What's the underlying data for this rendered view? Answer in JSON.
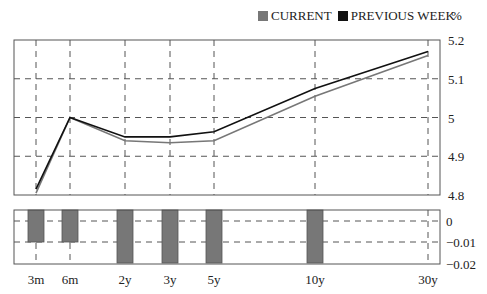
{
  "legend": {
    "items": [
      {
        "label": "CURRENT",
        "color": "#777777"
      },
      {
        "label": "PREVIOUS WEEK",
        "color": "#111111"
      }
    ],
    "unit": "%"
  },
  "chart_data": [
    {
      "type": "line",
      "title": "",
      "categories": [
        "3m",
        "6m",
        "2y",
        "3y",
        "5y",
        "10y",
        "30y"
      ],
      "series": [
        {
          "name": "CURRENT",
          "color": "#777777",
          "values": [
            4.805,
            5.0,
            4.94,
            4.935,
            4.94,
            5.055,
            5.16
          ]
        },
        {
          "name": "PREVIOUS WEEK",
          "color": "#111111",
          "values": [
            4.815,
            5.0,
            4.95,
            4.95,
            4.963,
            5.075,
            5.17
          ]
        }
      ],
      "ylabel": "%",
      "ylim": [
        4.8,
        5.2
      ],
      "yticks": [
        "5.2",
        "5.1",
        "5",
        "4.9",
        "4.8"
      ],
      "grid": true,
      "legend_position": "top-right"
    },
    {
      "type": "bar",
      "title": "",
      "categories": [
        "3m",
        "6m",
        "2y",
        "3y",
        "5y",
        "10y",
        "30y"
      ],
      "values": [
        -0.01,
        -0.01,
        -0.02,
        -0.02,
        -0.02,
        -0.02,
        0
      ],
      "color": "#777777",
      "ylim": [
        -0.02,
        0.005
      ],
      "yticks": [
        "0",
        "-0.01",
        "-0.02"
      ],
      "grid": true
    }
  ],
  "x_labels": [
    "3m",
    "6m",
    "2y",
    "3y",
    "5y",
    "10y",
    "30y"
  ],
  "top_y_labels": [
    "5.2",
    "5.1",
    "5",
    "4.9",
    "4.8"
  ],
  "bottom_y_labels": [
    "0",
    "−0.01",
    "−0.02"
  ]
}
